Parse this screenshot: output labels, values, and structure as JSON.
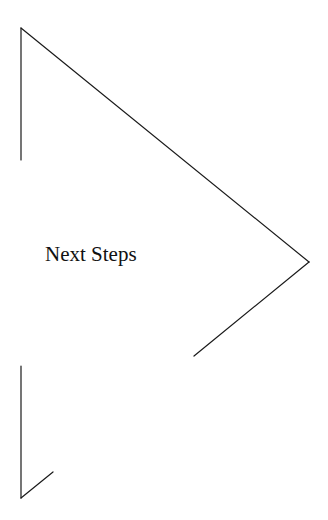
{
  "diagram": {
    "label": "Next Steps",
    "stroke_color": "#1a1a1a",
    "background": "#ffffff",
    "segments": [
      {
        "name": "upper-left-vertical",
        "x1": 21,
        "y1": 28,
        "x2": 21,
        "y2": 160
      },
      {
        "name": "upper-diagonal",
        "x1": 21,
        "y1": 28,
        "x2": 309,
        "y2": 262
      },
      {
        "name": "lower-right-diagonal",
        "x1": 309,
        "y1": 262,
        "x2": 194,
        "y2": 356
      },
      {
        "name": "lower-left-vertical",
        "x1": 21,
        "y1": 366,
        "x2": 21,
        "y2": 498
      },
      {
        "name": "bottom-short-diagonal",
        "x1": 21,
        "y1": 498,
        "x2": 53,
        "y2": 472
      }
    ]
  }
}
